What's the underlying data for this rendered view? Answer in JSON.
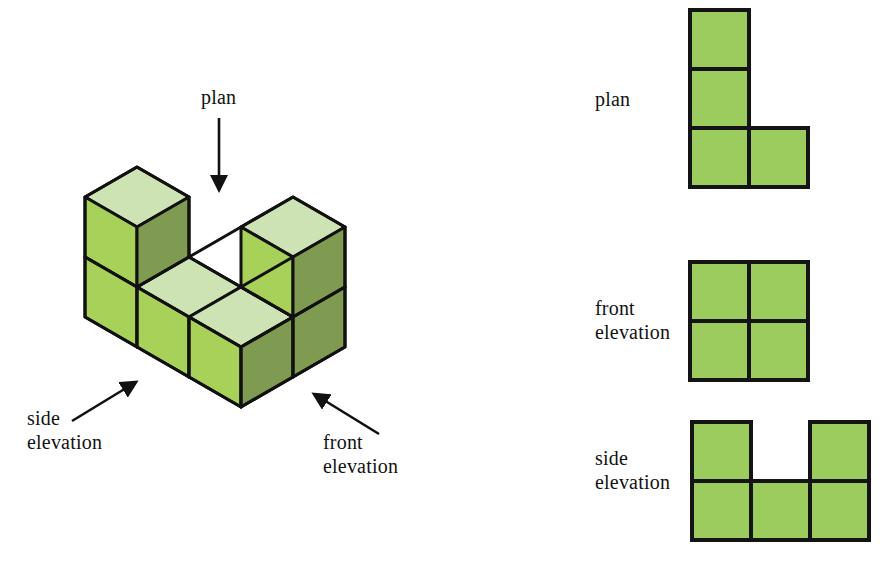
{
  "figure": {
    "kind": "isometric-cube-assembly",
    "title_labels": {
      "plan": "plan",
      "front_elevation_line1": "front",
      "front_elevation_line2": "elevation",
      "side_elevation_line1": "side",
      "side_elevation_line2": "elevation"
    },
    "colors": {
      "top_face": "#cde3b4",
      "left_face": "#a7d159",
      "right_face": "#7f9b52",
      "outline": "#111111",
      "ortho_fill": "#9ccc5e",
      "ortho_stroke": "#141414",
      "arrow": "#111111",
      "background": "#ffffff"
    },
    "arrows": [
      {
        "name": "plan-arrow",
        "from_x": 219,
        "from_y": 118,
        "to_x": 219,
        "to_y": 196,
        "direction": "down"
      },
      {
        "name": "side-elevation-arrow",
        "from_x": 72,
        "from_y": 420,
        "to_x": 139,
        "to_y": 379,
        "direction": "up-right"
      },
      {
        "name": "front-elevation-arrow",
        "from_x": 378,
        "from_y": 433,
        "to_x": 311,
        "to_y": 392,
        "direction": "up-left"
      }
    ],
    "cubes_note": "U-shaped assembly of 5 unit cubes: three cubes in a row at the base plus one cube stacked on each end"
  },
  "iso_labels": {
    "plan": "plan",
    "side_l1": "side",
    "side_l2": "elevation",
    "front_l1": "front",
    "front_l2": "elevation"
  },
  "views": [
    {
      "id": "plan",
      "label": "plan",
      "label_lines": [
        "plan"
      ],
      "type": "grid",
      "cols": 2,
      "rows": 3,
      "cell_px": 59,
      "filled": [
        [
          true,
          false
        ],
        [
          true,
          false
        ],
        [
          true,
          true
        ]
      ]
    },
    {
      "id": "front-elevation",
      "label": "front elevation",
      "label_lines": [
        "front",
        "elevation"
      ],
      "type": "grid",
      "cols": 2,
      "rows": 2,
      "cell_px": 59,
      "filled": [
        [
          true,
          true
        ],
        [
          true,
          true
        ]
      ]
    },
    {
      "id": "side-elevation",
      "label": "side elevation",
      "label_lines": [
        "side",
        "elevation"
      ],
      "type": "grid",
      "cols": 3,
      "rows": 2,
      "cell_px": 59,
      "filled": [
        [
          true,
          false,
          true
        ],
        [
          true,
          true,
          true
        ]
      ]
    }
  ]
}
